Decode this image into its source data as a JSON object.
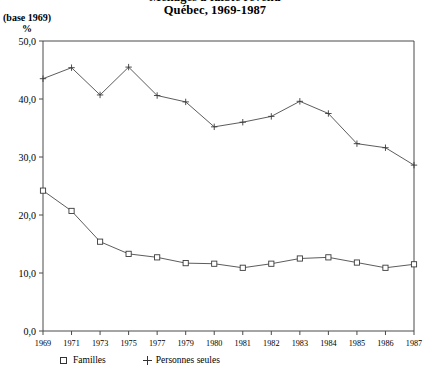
{
  "chart_data": {
    "type": "line",
    "title": "Ménages à faible revenu",
    "subtitle": "Québec, 1969-1987",
    "base_note": "(base 1969)",
    "ylabel": "%",
    "xlabel": "",
    "grid": false,
    "legend_position": "bottom-left",
    "ylim": [
      0,
      50
    ],
    "ytick_labels": [
      "0,0",
      "10,0",
      "20,0",
      "30,0",
      "40,0",
      "50,0"
    ],
    "ytick_values": [
      0,
      10,
      20,
      30,
      40,
      50
    ],
    "categories": [
      "1969",
      "1971",
      "1973",
      "1975",
      "1977",
      "1979",
      "1980",
      "1981",
      "1982",
      "1983",
      "1984",
      "1985",
      "1986",
      "1987"
    ],
    "series": [
      {
        "name": "Familles",
        "marker": "square",
        "values": [
          24.2,
          20.7,
          15.4,
          13.3,
          12.7,
          11.7,
          11.6,
          10.9,
          11.6,
          12.5,
          12.7,
          11.8,
          10.9,
          11.5
        ]
      },
      {
        "name": "Personnes seules",
        "marker": "plus",
        "values": [
          43.5,
          45.4,
          40.7,
          45.5,
          40.6,
          39.5,
          35.2,
          36.0,
          37.0,
          39.6,
          37.5,
          32.3,
          31.6,
          28.6
        ]
      }
    ]
  },
  "legend": {
    "items": [
      {
        "label": "Familles",
        "marker": "square"
      },
      {
        "label": "Personnes seules",
        "marker": "plus"
      }
    ]
  }
}
